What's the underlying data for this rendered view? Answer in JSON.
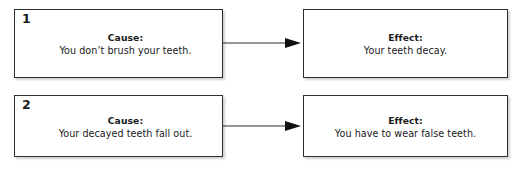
{
  "diagram": {
    "type": "cause-and-effect-flowchart",
    "colors": {
      "border": "#2e2e2e",
      "text": "#1a1a1a",
      "background": "#ffffff",
      "arrow": "#2e2e2e"
    },
    "rows": [
      {
        "number": "1",
        "cause": {
          "label": "Cause:",
          "text": "You don’t brush your teeth."
        },
        "effect": {
          "label": "Effect:",
          "text": "Your teeth decay."
        },
        "connector": "arrow-right-icon"
      },
      {
        "number": "2",
        "cause": {
          "label": "Cause:",
          "text": "Your decayed teeth fall out."
        },
        "effect": {
          "label": "Effect:",
          "text": "You have to wear false teeth."
        },
        "connector": "arrow-right-icon"
      }
    ]
  }
}
